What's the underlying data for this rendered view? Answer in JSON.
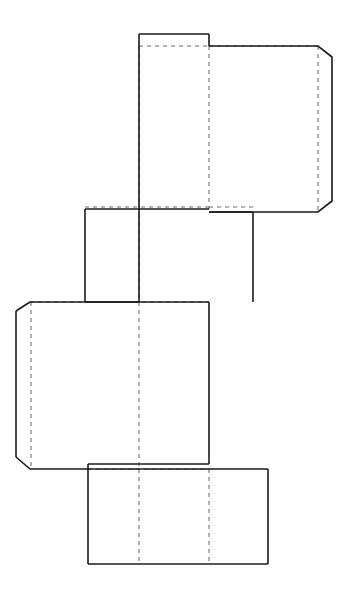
{
  "document": {
    "title": "Carton Dieline Net",
    "type": "packaging-dieline",
    "width": 356,
    "height": 595,
    "background_color": "#ffffff"
  },
  "legend": {
    "cut_line_label": "Cut line (solid)",
    "fold_line_label": "Fold line (dashed)",
    "cut_color": "#1a1a1a",
    "fold_color": "#6f6f6f"
  },
  "geometry": {
    "cut_paths": [
      "M 139 34 L 209 34",
      "M 139 34 L 139 302",
      "M 209 34 L 209 46",
      "M 209 46 L 318 46 L 332 57 L 332 201 L 318 212 L 209 212",
      "M 85 209 L 85 302",
      "M 85 209 L 209 209",
      "M 253 212 L 253 302",
      "M 209 212 L 253 212",
      "M 85 302 L 139 302",
      "M 30 302 L 209 302",
      "M 16 311 L 30 302",
      "M 16 311 L 16 457",
      "M 16 457 L 30 469",
      "M 30 469 L 209 469",
      "M 209 302 L 209 464",
      "M 88 464 L 209 464",
      "M 88 464 L 88 469",
      "M 88 469 L 88 564",
      "M 88 564 L 268 564",
      "M 268 469 L 268 564",
      "M 209 469 L 268 469"
    ],
    "fold_paths": [
      "M 139 46 L 209 46",
      "M 209 46 L 318 46",
      "M 209 46 L 209 209",
      "M 318 46 L 318 212",
      "M 139 46 L 139 302",
      "M 139 302 L 139 469",
      "M 85 207 L 209 207",
      "M 209 207 L 253 207",
      "M 31 302 L 31 469",
      "M 30 302 L 209 302",
      "M 139 469 L 139 564",
      "M 209 469 L 209 564",
      "M 88 469 L 209 469"
    ],
    "panels": [
      {
        "name": "top-panel",
        "x": 139,
        "y": 34,
        "w": 70,
        "h": 268
      },
      {
        "name": "top-right-flap",
        "x": 209,
        "y": 46,
        "w": 123,
        "h": 166
      },
      {
        "name": "middle-left-panel",
        "x": 85,
        "y": 209,
        "w": 124,
        "h": 93
      },
      {
        "name": "middle-right-panel",
        "x": 209,
        "y": 212,
        "w": 44,
        "h": 90
      },
      {
        "name": "large-left-panel",
        "x": 16,
        "y": 302,
        "w": 193,
        "h": 167
      },
      {
        "name": "bottom-panel",
        "x": 88,
        "y": 469,
        "w": 180,
        "h": 95
      }
    ],
    "slits": [
      {
        "name": "upper-slit",
        "x1": 209,
        "x2": 253,
        "y_fold": 207,
        "y_cut": 212
      },
      {
        "name": "lower-slit",
        "x1": 88,
        "x2": 209,
        "y_fold": 469,
        "y_cut": 464
      }
    ],
    "chamfers": [
      {
        "name": "top-right-flap-upper-chamfer",
        "from": [
          318,
          46
        ],
        "to": [
          332,
          57
        ]
      },
      {
        "name": "top-right-flap-lower-chamfer",
        "from": [
          332,
          201
        ],
        "to": [
          318,
          212
        ]
      },
      {
        "name": "large-left-panel-upper-chamfer",
        "from": [
          30,
          302
        ],
        "to": [
          16,
          311
        ]
      },
      {
        "name": "large-left-panel-lower-chamfer",
        "from": [
          16,
          457
        ],
        "to": [
          30,
          469
        ]
      }
    ]
  }
}
